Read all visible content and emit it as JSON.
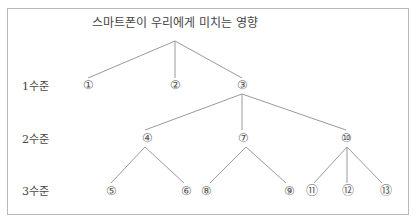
{
  "title": "스마트폰이 우리에게 미치는 영향",
  "levels": [
    {
      "label": "1수준"
    },
    {
      "label": "2수준"
    },
    {
      "label": "3수준"
    }
  ],
  "nodes": {
    "n1": "①",
    "n2": "②",
    "n3": "③",
    "n4": "④",
    "n7": "⑦",
    "n10": "⑩",
    "n5": "⑤",
    "n6": "⑥",
    "n8": "⑧",
    "n9": "⑨",
    "n11": "⑪",
    "n12": "⑫",
    "n13": "⑬"
  },
  "colors": {
    "line": "#9a9a9a",
    "border": "#b8b8b8",
    "text": "#444444"
  }
}
